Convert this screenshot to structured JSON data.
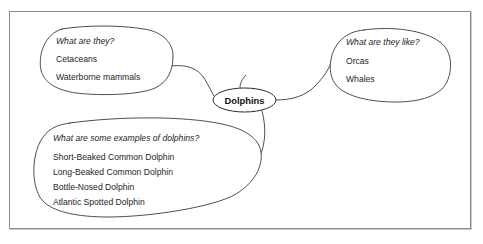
{
  "diagram": {
    "center_node": {
      "label": "Dolphins"
    },
    "bubbles": [
      {
        "id": "what-are-they",
        "question": "What are they?",
        "items": [
          "Cetaceans",
          "Waterborne mammals"
        ]
      },
      {
        "id": "what-are-they-like",
        "question": "What are they like?",
        "items": [
          "Orcas",
          "Whales"
        ]
      },
      {
        "id": "examples",
        "question": "What are some examples of dolphins?",
        "items": [
          "Short-Beaked Common Dolphin",
          "Long-Beaked Common Dolphin",
          "Bottle-Nosed Dolphin",
          "Atlantic Spotted Dolphin"
        ]
      }
    ],
    "colors": {
      "background": "#ffffff",
      "frame_border": "#8a8a8a",
      "bubble_stroke": "#3a3a3a",
      "text": "#231f20"
    }
  }
}
